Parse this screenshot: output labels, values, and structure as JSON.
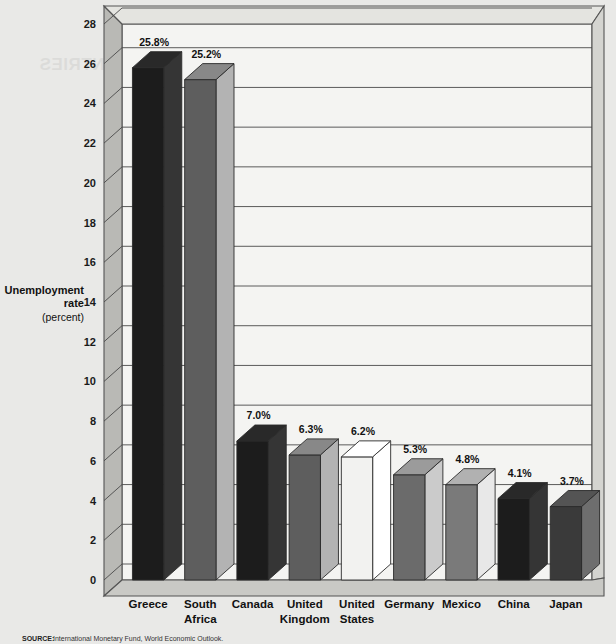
{
  "chart_data": {
    "type": "bar",
    "title": "",
    "subtitle": "",
    "xlabel": "",
    "ylabel": "Unemployment rate (percent)",
    "ylabel_lines": [
      "Unemployment",
      "rate",
      "(percent)"
    ],
    "categories": [
      "Greece",
      "South Africa",
      "Canada",
      "United Kingdom",
      "United States",
      "Germany",
      "Mexico",
      "China",
      "Japan"
    ],
    "category_label_lines": [
      [
        "Greece"
      ],
      [
        "South",
        "Africa"
      ],
      [
        "Canada"
      ],
      [
        "United",
        "Kingdom"
      ],
      [
        "United",
        "States"
      ],
      [
        "Germany"
      ],
      [
        "Mexico"
      ],
      [
        "China"
      ],
      [
        "Japan"
      ]
    ],
    "values": [
      25.8,
      25.2,
      7.0,
      6.3,
      6.2,
      5.3,
      4.8,
      4.1,
      3.7
    ],
    "value_labels": [
      "25.8%",
      "25.2%",
      "7.0%",
      "6.3%",
      "6.2%",
      "5.3%",
      "4.8%",
      "4.1%",
      "3.7%"
    ],
    "bar_colors": [
      "#1c1c1c",
      "#5e5e5e",
      "#1c1c1c",
      "#5e5e5e",
      "#f2f2f0",
      "#6b6b6b",
      "#7a7a7a",
      "#1c1c1c",
      "#3a3a3a"
    ],
    "ylim": [
      0,
      28
    ],
    "ytick_step": 2,
    "yticks": [
      "0",
      "2",
      "4",
      "6",
      "8",
      "10",
      "12",
      "14",
      "16",
      "18",
      "20",
      "22",
      "24",
      "26",
      "28"
    ],
    "grid": true,
    "legend": "none",
    "style": "3d-bars"
  },
  "source": {
    "label": "SOURCE:",
    "text": "International Monetary Fund, World Economic Outlook."
  },
  "bleedthrough": {
    "line1": "THE U.S. ECONOMY COMPARED WITH OTHER COUNTRIES"
  }
}
